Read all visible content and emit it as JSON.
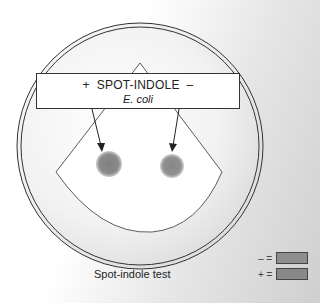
{
  "label_box": {
    "plus_sign": "+",
    "title": "SPOT-INDOLE",
    "minus_sign": "–",
    "organism": "E. coli"
  },
  "caption": "Spot-indole test",
  "legend": [
    {
      "symbol": "– =",
      "color": "#8e8e8e"
    },
    {
      "symbol": "+ =",
      "color": "#888888"
    }
  ],
  "spots": [
    {
      "name": "positive",
      "color": "#8a8a8a"
    },
    {
      "name": "negative",
      "color": "#8f8f8f"
    }
  ],
  "colors": {
    "background_light": "#ffffff",
    "background_dark": "#cfcfcf",
    "outline": "#333333"
  }
}
